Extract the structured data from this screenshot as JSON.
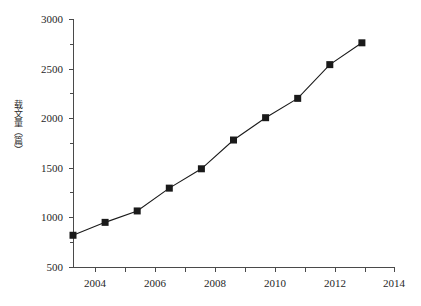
{
  "chart_data": {
    "type": "line",
    "title": "",
    "subtitle": "",
    "xlabel": "",
    "ylabel": "载文量（篇）",
    "x": [
      2004,
      2005,
      2006,
      2007,
      2008,
      2009,
      2010,
      2011,
      2012,
      2013
    ],
    "values": [
      820,
      950,
      1065,
      1295,
      1490,
      1780,
      2005,
      2200,
      2540,
      2760
    ],
    "series": [
      {
        "name": "载文量",
        "values": [
          820,
          950,
          1065,
          1295,
          1490,
          1780,
          2005,
          2200,
          2540,
          2760
        ]
      }
    ],
    "xlim": [
      2004,
      2014
    ],
    "ylim": [
      500,
      3000
    ],
    "x_ticks": [
      2004,
      2005,
      2006,
      2007,
      2008,
      2009,
      2010,
      2011,
      2012,
      2013,
      2014
    ],
    "x_tick_labels": [
      "2004",
      "",
      "2006",
      "",
      "2008",
      "",
      "2010",
      "",
      "2012",
      "",
      "2014"
    ],
    "y_ticks": [
      500,
      750,
      1000,
      1250,
      1500,
      1750,
      2000,
      2250,
      2500,
      2750,
      3000
    ],
    "y_tick_labels": [
      "500",
      "",
      "1000",
      "",
      "1500",
      "",
      "2000",
      "",
      "2500",
      "",
      "3000"
    ],
    "grid": false,
    "legend": "none",
    "marker": "square",
    "series_color": "#1a1a1a",
    "axis_color": "#4a4a4a",
    "background_color": "#ffffff",
    "annotations": []
  },
  "axis": {
    "y_title": "载文量（篇）",
    "y_labels": {
      "t500": "500",
      "t1000": "1000",
      "t1500": "1500",
      "t2000": "2000",
      "t2500": "2500",
      "t3000": "3000"
    },
    "x_labels": {
      "t2004": "2004",
      "t2006": "2006",
      "t2008": "2008",
      "t2010": "2010",
      "t2012": "2012",
      "t2014": "2014"
    }
  },
  "caption": {
    "text": ""
  }
}
